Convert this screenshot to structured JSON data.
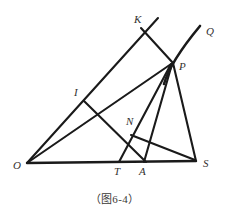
{
  "figure": {
    "caption": "（图6-4）",
    "stroke_color": "#1a1a1a",
    "label_color": "#33312f",
    "background_color": "#ffffff",
    "line_width": 2.0,
    "points": [
      {
        "id": "O",
        "label": "O",
        "x": 27,
        "y": 163,
        "label_x": 13,
        "label_y": 169
      },
      {
        "id": "S",
        "label": "S",
        "x": 196,
        "y": 161,
        "label_x": 203,
        "label_y": 167
      },
      {
        "id": "T",
        "label": "T",
        "x": 119,
        "y": 162,
        "label_x": 114,
        "label_y": 175
      },
      {
        "id": "A",
        "label": "A",
        "x": 144,
        "y": 162,
        "label_x": 139,
        "label_y": 175
      },
      {
        "id": "P",
        "label": "P",
        "x": 172,
        "y": 62,
        "label_x": 179,
        "label_y": 70
      },
      {
        "id": "K",
        "label": "K",
        "x": 144,
        "y": 31,
        "label_x": 134,
        "label_y": 23
      },
      {
        "id": "Q",
        "label": "Q",
        "x": 200,
        "y": 26,
        "label_x": 206,
        "label_y": 35
      },
      {
        "id": "I",
        "label": "I",
        "x": 84,
        "y": 101,
        "label_x": 74,
        "label_y": 96
      },
      {
        "id": "N",
        "label": "N",
        "x": 140,
        "y": 130,
        "label_x": 126,
        "label_y": 125
      }
    ],
    "segments": [
      {
        "name": "base-line-O-S",
        "from": "O",
        "to": "S"
      },
      {
        "name": "ray-O-to-K-upper",
        "from": "O",
        "to": "Kext"
      },
      {
        "name": "line-O-to-P",
        "from": "O",
        "to": "P"
      },
      {
        "name": "segment-K-to-P",
        "from": "K",
        "to": "P"
      },
      {
        "name": "segment-P-to-S",
        "from": "P",
        "to": "S"
      },
      {
        "name": "segment-P-to-A",
        "from": "P",
        "to": "A"
      },
      {
        "name": "segment-P-to-T",
        "from": "P",
        "to": "T"
      },
      {
        "name": "segment-I-to-A",
        "from": "I",
        "to": "A"
      },
      {
        "name": "segment-N-to-S",
        "from": "N",
        "to": "S"
      }
    ],
    "curve": {
      "name": "curve-P-to-Q",
      "description": "smooth curved arc passing through P rising to Q"
    },
    "icon_names": {
      "diagram": "geometry-diagram-icon"
    }
  }
}
